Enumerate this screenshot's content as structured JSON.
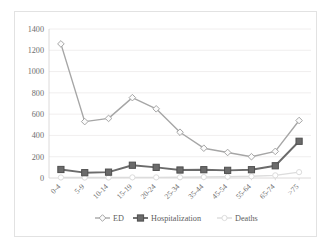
{
  "chart": {
    "type": "line",
    "title": "",
    "background_color": "#ffffff",
    "border_color": "#e2e2e2"
  },
  "chart_data": {
    "type": "line",
    "title": "",
    "subtitle": "",
    "xlabel": "",
    "ylabel": "",
    "categories": [
      "0-4",
      "5-9",
      "10-14",
      "15-19",
      "20-24",
      "25-34",
      "35-44",
      "45-54",
      "55-64",
      "65-74",
      ">75"
    ],
    "series": [
      {
        "name": "ED",
        "color": "#a6a6a6",
        "marker": "diamond",
        "values": [
          1260,
          530,
          560,
          755,
          650,
          430,
          280,
          240,
          200,
          250,
          540
        ]
      },
      {
        "name": "Hospitalization",
        "color": "#6b6b6b",
        "marker": "square",
        "values": [
          80,
          50,
          55,
          120,
          100,
          75,
          78,
          72,
          78,
          115,
          345
        ]
      },
      {
        "name": "Deaths",
        "color": "#dcdcdc",
        "marker": "circle",
        "values": [
          5,
          4,
          4,
          6,
          6,
          7,
          9,
          12,
          16,
          25,
          55
        ]
      }
    ],
    "ylim": [
      0,
      1400
    ],
    "yticks": [
      0,
      200,
      400,
      600,
      800,
      1000,
      1200,
      1400
    ],
    "ytick_labels": [
      "0",
      "200",
      "400",
      "600",
      "800",
      "1000",
      "1200",
      "1400"
    ],
    "grid": true,
    "grid_axis": "y",
    "legend_position": "bottom",
    "legend": [
      "ED",
      "Hospitalization",
      "Deaths"
    ]
  }
}
